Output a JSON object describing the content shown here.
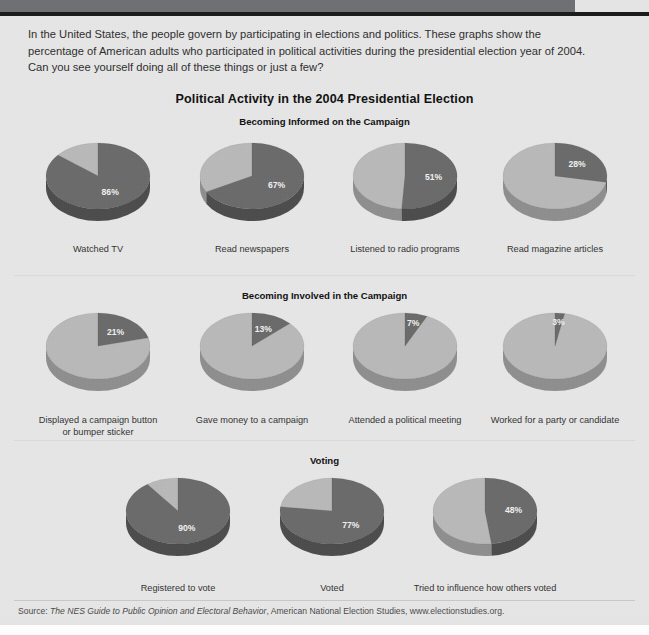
{
  "intro": {
    "text": "In the United States, the people govern by participating in elections and politics. These graphs show the percentage of American adults who participated in political activities during the presidential election year of 2004. Can you see yourself doing all of these things or just a few?"
  },
  "title": "Political Activity in the 2004 Presidential Election",
  "sections": [
    {
      "heading": "Becoming Informed on the Campaign"
    },
    {
      "heading": "Becoming Involved in the Campaign"
    },
    {
      "heading": "Voting"
    }
  ],
  "source": {
    "prefix": "Source: ",
    "italic_title": "The NES Guide to Public Opinion and Electoral Behavior",
    "rest": ", American National Election Studies, www.electionstudies.org."
  },
  "colors": {
    "page_background": "#e7e7e7",
    "banner": "#6f7073",
    "banner_rule": "#1b1b1b",
    "pie_dark": "#6b6b6b",
    "pie_light": "#b9b9b9",
    "pie_dark_side": "#4d4d4d",
    "pie_light_side": "#8f8f8f",
    "text": "#2e2e2e",
    "value_label": "#f2f2f2"
  },
  "chart_data": [
    {
      "type": "pie",
      "title": "Becoming Informed on the Campaign",
      "categories": [
        "Watched TV",
        "Read newspapers",
        "Listened to radio programs",
        "Read magazine articles"
      ],
      "values": [
        86,
        67,
        51,
        28
      ],
      "value_labels": [
        "86%",
        "67%",
        "51%",
        "28%"
      ],
      "unit": "percent",
      "slices": [
        "participated",
        "did not participate"
      ]
    },
    {
      "type": "pie",
      "title": "Becoming Involved in the Campaign",
      "categories": [
        "Displayed a campaign button or bumper sticker",
        "Gave money to a campaign",
        "Attended a political meeting",
        "Worked for a party or candidate"
      ],
      "values": [
        21,
        13,
        7,
        3
      ],
      "value_labels": [
        "21%",
        "13%",
        "7%",
        "3%"
      ],
      "unit": "percent",
      "slices": [
        "participated",
        "did not participate"
      ]
    },
    {
      "type": "pie",
      "title": "Voting",
      "categories": [
        "Registered to vote",
        "Voted",
        "Tried to influence how others voted"
      ],
      "values": [
        90,
        77,
        48
      ],
      "value_labels": [
        "90%",
        "77%",
        "48%"
      ],
      "unit": "percent",
      "slices": [
        "participated",
        "did not participate"
      ]
    }
  ],
  "pies": {
    "row1": [
      {
        "label": "Watched TV",
        "value": 86,
        "value_label": "86%",
        "label_line2": ""
      },
      {
        "label": "Read newspapers",
        "value": 67,
        "value_label": "67%",
        "label_line2": ""
      },
      {
        "label": "Listened to radio programs",
        "value": 51,
        "value_label": "51%",
        "label_line2": ""
      },
      {
        "label": "Read magazine articles",
        "value": 28,
        "value_label": "28%",
        "label_line2": ""
      }
    ],
    "row2": [
      {
        "label": "Displayed a campaign button",
        "value": 21,
        "value_label": "21%",
        "label_line2": "or bumper sticker"
      },
      {
        "label": "Gave money to a campaign",
        "value": 13,
        "value_label": "13%",
        "label_line2": ""
      },
      {
        "label": "Attended a political meeting",
        "value": 7,
        "value_label": "7%",
        "label_line2": ""
      },
      {
        "label": "Worked for a party or candidate",
        "value": 3,
        "value_label": "3%",
        "label_line2": ""
      }
    ],
    "row3": [
      {
        "label": "Registered to vote",
        "value": 90,
        "value_label": "90%",
        "label_line2": ""
      },
      {
        "label": "Voted",
        "value": 77,
        "value_label": "77%",
        "label_line2": ""
      },
      {
        "label": "Tried to influence how others voted",
        "value": 48,
        "value_label": "48%",
        "label_line2": ""
      }
    ]
  }
}
